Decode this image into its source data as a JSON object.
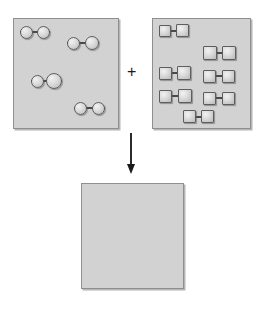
{
  "diagram": {
    "operator_label": "+",
    "arrow": {
      "name": "reaction-arrow",
      "direction": "down",
      "x": 131,
      "y_start": 133,
      "y_end": 174
    }
  },
  "reactant_a": {
    "name": "reactant-container-circles",
    "particle_shape": "circle",
    "molecule_count": 4,
    "atoms_per_molecule": 2,
    "total_atoms": 8,
    "box": {
      "x": 13,
      "y": 18,
      "width": 106,
      "height": 111
    },
    "fill_color": "#d2d2d2",
    "border_color": "#8f8f8f",
    "molecules": [
      {
        "id": "circle-pair-1",
        "x": 20,
        "y": 25,
        "width": 30,
        "height": 14,
        "left_size": 13,
        "right_size": 13
      },
      {
        "id": "circle-pair-2",
        "x": 67,
        "y": 36,
        "width": 32,
        "height": 14,
        "left_size": 13,
        "right_size": 14
      },
      {
        "id": "circle-pair-3",
        "x": 31,
        "y": 73,
        "width": 31,
        "height": 16,
        "left_size": 13,
        "right_size": 16
      },
      {
        "id": "circle-pair-4",
        "x": 74,
        "y": 101,
        "width": 31,
        "height": 14,
        "left_size": 13,
        "right_size": 13
      }
    ]
  },
  "reactant_b": {
    "name": "reactant-container-squares",
    "particle_shape": "square",
    "molecule_count": 7,
    "atoms_per_molecule": 2,
    "total_atoms": 14,
    "box": {
      "x": 152,
      "y": 18,
      "width": 99,
      "height": 111
    },
    "fill_color": "#d2d2d2",
    "border_color": "#8f8f8f",
    "molecules": [
      {
        "id": "square-pair-1",
        "x": 159,
        "y": 24,
        "width": 30,
        "height": 13,
        "left_size": 12,
        "right_size": 13
      },
      {
        "id": "square-pair-2",
        "x": 203,
        "y": 46,
        "width": 33,
        "height": 14,
        "left_size": 14,
        "right_size": 14
      },
      {
        "id": "square-pair-3",
        "x": 159,
        "y": 66,
        "width": 32,
        "height": 14,
        "left_size": 13,
        "right_size": 14
      },
      {
        "id": "square-pair-4",
        "x": 203,
        "y": 69,
        "width": 32,
        "height": 14,
        "left_size": 13,
        "right_size": 13
      },
      {
        "id": "square-pair-5",
        "x": 159,
        "y": 89,
        "width": 33,
        "height": 14,
        "left_size": 13,
        "right_size": 14
      },
      {
        "id": "square-pair-6",
        "x": 203,
        "y": 91,
        "width": 32,
        "height": 14,
        "left_size": 13,
        "right_size": 13
      },
      {
        "id": "square-pair-7",
        "x": 183,
        "y": 110,
        "width": 31,
        "height": 13,
        "left_size": 13,
        "right_size": 13
      }
    ]
  },
  "product": {
    "name": "product-container-empty",
    "particle_shape": "none",
    "molecule_count": 0,
    "total_atoms": 0,
    "box": {
      "x": 81,
      "y": 183,
      "width": 103,
      "height": 106
    },
    "fill_color": "#d2d2d2",
    "border_color": "#8f8f8f",
    "molecules": []
  }
}
